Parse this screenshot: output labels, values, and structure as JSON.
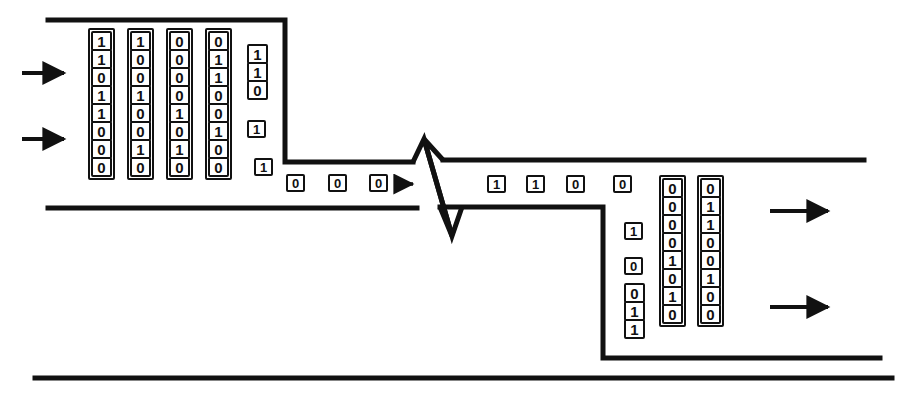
{
  "diagram": {
    "stroke_color": "#111111",
    "background_color": "#ffffff",
    "bit_values": [
      "0",
      "1"
    ]
  },
  "input_arrows": [
    {
      "name": "input-arrow-1",
      "label": "→"
    },
    {
      "name": "input-arrow-2",
      "label": "→"
    }
  ],
  "output_arrows": [
    {
      "name": "output-arrow-1",
      "label": "→"
    },
    {
      "name": "output-arrow-2",
      "label": "→"
    }
  ],
  "flow_arrow": {
    "name": "flow-arrow",
    "label": "→"
  },
  "break_symbol": {
    "name": "break-symbol",
    "label": "zigzag-break"
  },
  "input_columns": [
    {
      "name": "input-column-1",
      "x": 88,
      "y": 28,
      "bits": [
        "1",
        "1",
        "0",
        "1",
        "1",
        "0",
        "0",
        "0"
      ]
    },
    {
      "name": "input-column-2",
      "x": 127,
      "y": 28,
      "bits": [
        "1",
        "0",
        "0",
        "1",
        "0",
        "0",
        "1",
        "0"
      ]
    },
    {
      "name": "input-column-3",
      "x": 166,
      "y": 28,
      "bits": [
        "0",
        "0",
        "0",
        "0",
        "1",
        "0",
        "1",
        "0"
      ]
    },
    {
      "name": "input-column-4",
      "x": 205,
      "y": 28,
      "bits": [
        "0",
        "1",
        "1",
        "0",
        "0",
        "1",
        "0",
        "0"
      ]
    }
  ],
  "input_stagger": {
    "name": "input-stagger-group",
    "top_stack": {
      "x": 247,
      "y": 44,
      "bits": [
        "1",
        "1",
        "0"
      ]
    },
    "loose_bits": [
      {
        "name": "stagger-bit-1",
        "x": 247,
        "y": 120,
        "value": "1"
      },
      {
        "name": "stagger-bit-2",
        "x": 254,
        "y": 158,
        "value": "1"
      }
    ]
  },
  "serial_in_bits": [
    {
      "name": "serial-in-bit-1",
      "x": 286,
      "y": 174,
      "value": "0"
    },
    {
      "name": "serial-in-bit-2",
      "x": 328,
      "y": 174,
      "value": "0"
    },
    {
      "name": "serial-in-bit-3",
      "x": 369,
      "y": 174,
      "value": "0"
    }
  ],
  "serial_out_bits": [
    {
      "name": "serial-out-bit-1",
      "x": 487,
      "y": 175,
      "value": "1"
    },
    {
      "name": "serial-out-bit-2",
      "x": 526,
      "y": 175,
      "value": "1"
    },
    {
      "name": "serial-out-bit-3",
      "x": 566,
      "y": 175,
      "value": "0"
    }
  ],
  "output_stagger": {
    "name": "output-stagger-group",
    "loose_bits": [
      {
        "name": "out-stagger-bit-1",
        "x": 613,
        "y": 175,
        "value": "0"
      },
      {
        "name": "out-stagger-bit-2",
        "x": 624,
        "y": 222,
        "value": "1"
      },
      {
        "name": "out-stagger-bit-3",
        "x": 624,
        "y": 257,
        "value": "0"
      }
    ],
    "bottom_stack": {
      "x": 624,
      "y": 283,
      "bits": [
        "0",
        "1",
        "1"
      ]
    }
  },
  "output_columns": [
    {
      "name": "output-column-1",
      "x": 659,
      "y": 175,
      "bits": [
        "0",
        "0",
        "0",
        "0",
        "1",
        "0",
        "1",
        "0"
      ]
    },
    {
      "name": "output-column-2",
      "x": 697,
      "y": 175,
      "bits": [
        "0",
        "1",
        "1",
        "0",
        "0",
        "1",
        "0",
        "0"
      ]
    }
  ],
  "pipe_paths": {
    "top_wide_edge": "M 48,20 L 285,20",
    "funnel_right_drop": "M 285,20 L 285,162",
    "upper_narrow_edge": "M 285,162 L 413,162",
    "lower_wide_edge": "M 48,208 L 417,208",
    "upper_right_edge": "M 443,160 L 864,160",
    "lower_right_step": "M 440,207 L 603,207",
    "right_drop": "M 603,207 L 603,358",
    "bottom_right_edge": "M 603,358 L 880,358",
    "bottom_outer_edge": "M 35,378 L 892,378",
    "break_zigzag": "M 413,162 L 424,139 L 452,235 L 462,207"
  }
}
